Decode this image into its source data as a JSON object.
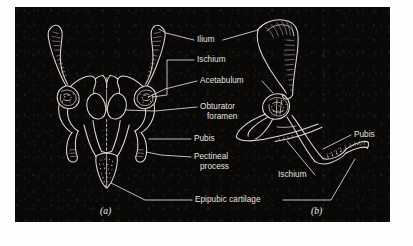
{
  "figure": {
    "plate_background": "#090807",
    "ink_color": "#e8e6e0",
    "page_background": "#ffffff",
    "panels": [
      {
        "id": "a",
        "caption": "(a)",
        "view": "ventral"
      },
      {
        "id": "b",
        "caption": "(b)",
        "view": "lateral"
      }
    ]
  },
  "labels": {
    "ilium": "Ilium",
    "ischium": "Ischium",
    "acetabulum": "Acetabulum",
    "obturator_line1": "Obturator",
    "obturator_line2": "foramen",
    "pubis": "Pubis",
    "pectineal_line1": "Pectineal",
    "pectineal_line2": "process",
    "epipubic": "Epipubic cartilage",
    "pubis_right": "Pubis",
    "ischium_right": "Ischium"
  },
  "captions": {
    "panel_a": "(a)",
    "panel_b": "(b)"
  }
}
